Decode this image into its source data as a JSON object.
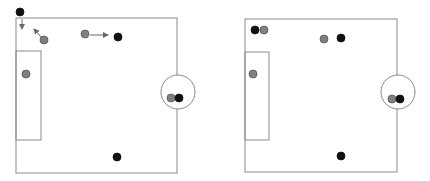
{
  "colors": {
    "line": "#8a8a8a",
    "arrow": "#6a6a6a",
    "black_player": "#111111",
    "gray_player": "#808080",
    "gray_outline": "#555555",
    "background": "#ffffff"
  },
  "diagrams": [
    {
      "id": "left",
      "field": {
        "x": 16,
        "y": 18,
        "w": 161,
        "h": 155
      },
      "zone": {
        "x": 16,
        "y": 51,
        "w": 25,
        "h": 89
      },
      "circle": {
        "cx": 178,
        "cy": 92,
        "r": 17
      },
      "players": [
        {
          "team": "black",
          "x": 20,
          "y": 12
        },
        {
          "team": "gray",
          "x": 44,
          "y": 40
        },
        {
          "team": "gray",
          "x": 85,
          "y": 34
        },
        {
          "team": "black",
          "x": 118,
          "y": 37
        },
        {
          "team": "gray",
          "x": 26,
          "y": 74
        },
        {
          "team": "gray",
          "x": 171,
          "y": 98
        },
        {
          "team": "black",
          "x": 179,
          "y": 98
        },
        {
          "team": "black",
          "x": 117,
          "y": 157
        }
      ],
      "arrows": [
        {
          "x1": 22,
          "y1": 19,
          "x2": 22,
          "y2": 29
        },
        {
          "x1": 41,
          "y1": 37,
          "x2": 34,
          "y2": 29
        },
        {
          "x1": 90,
          "y1": 35,
          "x2": 108,
          "y2": 35
        }
      ]
    },
    {
      "id": "right",
      "field": {
        "x": 245,
        "y": 19,
        "w": 152,
        "h": 153
      },
      "zone": {
        "x": 245,
        "y": 52,
        "w": 24,
        "h": 88
      },
      "circle": {
        "cx": 398,
        "cy": 92,
        "r": 17
      },
      "players": [
        {
          "team": "black",
          "x": 255,
          "y": 30
        },
        {
          "team": "gray",
          "x": 264,
          "y": 30
        },
        {
          "team": "gray",
          "x": 324,
          "y": 39
        },
        {
          "team": "black",
          "x": 341,
          "y": 38
        },
        {
          "team": "gray",
          "x": 253,
          "y": 74
        },
        {
          "team": "gray",
          "x": 392,
          "y": 99
        },
        {
          "team": "black",
          "x": 400,
          "y": 99
        },
        {
          "team": "black",
          "x": 341,
          "y": 156
        }
      ],
      "arrows": []
    }
  ]
}
